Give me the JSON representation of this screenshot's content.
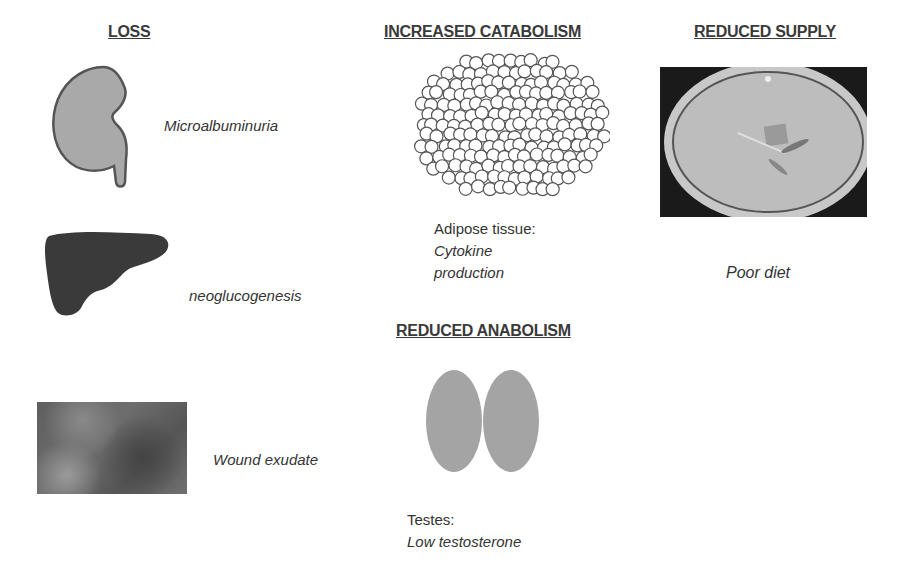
{
  "columns": {
    "loss": {
      "heading": "LOSS",
      "items": [
        {
          "icon": "kidney-icon",
          "label": "Microalbuminuria",
          "color": "#a8a8a8"
        },
        {
          "icon": "liver-icon",
          "label": "neoglucogenesis",
          "color": "#3c3c3c"
        },
        {
          "icon": "wound-photo",
          "label": "Wound exudate"
        }
      ]
    },
    "catabolism": {
      "heading": "INCREASED CATABOLISM",
      "image": "adipose-cells-icon",
      "caption_line1": "Adipose tissue:",
      "caption_line2": "Cytokine",
      "caption_line3": "production"
    },
    "anabolism": {
      "heading": "REDUCED ANABOLISM",
      "image": "testes-icon",
      "caption_line1": "Testes:",
      "caption_line2": "Low testosterone"
    },
    "supply": {
      "heading": "REDUCED SUPPLY",
      "image": "empty-plate-photo",
      "caption": "Poor diet"
    }
  }
}
